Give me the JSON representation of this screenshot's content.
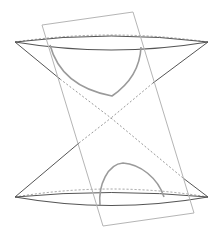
{
  "diagram": {
    "colors": {
      "background": "#ffffff",
      "cone": "#555555",
      "hidden": "#9a9a9a",
      "plane": "#b5b5b5",
      "section": "#9a9a9a"
    },
    "apex": [
      111,
      118
    ],
    "upper_cone": {
      "rim_left": [
        15,
        42
      ],
      "rim_right": [
        208,
        42
      ],
      "rim_front_path": "M15,42 Q111,58 208,42",
      "rim_back_path": "M15,42 Q111,28 208,42"
    },
    "lower_cone": {
      "rim_left": [
        15,
        197
      ],
      "rim_right": [
        208,
        197
      ],
      "rim_front_path": "M15,197 Q111,214 208,197",
      "rim_back_path": "M15,197 Q111,181 208,197"
    },
    "plane": {
      "corners": [
        [
          42,
          25
        ],
        [
          133,
          12
        ],
        [
          194,
          213
        ],
        [
          103,
          226
        ]
      ]
    },
    "section_curves": {
      "upper_branch": "M50,45 C58,75 80,90 112,96 C128,85 140,70 141,47",
      "lower_branch": "M100,205 C98,185 108,164 123,163 C140,164 158,178 164,197"
    }
  }
}
